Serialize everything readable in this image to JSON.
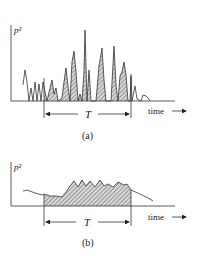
{
  "figure_a": {
    "ylabel": "p²",
    "xlabel": "time",
    "interval_label": "T",
    "caption": "(a)",
    "signal_points": [
      [
        23,
        85
      ],
      [
        25,
        70
      ],
      [
        27,
        82
      ],
      [
        29,
        101
      ],
      [
        31,
        88
      ],
      [
        33,
        101
      ],
      [
        35,
        82
      ],
      [
        37,
        101
      ],
      [
        39,
        84
      ],
      [
        41,
        101
      ],
      [
        43,
        82
      ],
      [
        45,
        92
      ],
      [
        47,
        101
      ],
      [
        50,
        88
      ],
      [
        52,
        80
      ],
      [
        54,
        94
      ],
      [
        56,
        88
      ],
      [
        58,
        101
      ],
      [
        62,
        98
      ],
      [
        64,
        82
      ],
      [
        66,
        68
      ],
      [
        68,
        86
      ],
      [
        70,
        101
      ],
      [
        72,
        62
      ],
      [
        74,
        51
      ],
      [
        76,
        72
      ],
      [
        78,
        101
      ],
      [
        80,
        94
      ],
      [
        82,
        101
      ],
      [
        84,
        72
      ],
      [
        85,
        30
      ],
      [
        87,
        101
      ],
      [
        89,
        70
      ],
      [
        91,
        101
      ],
      [
        96,
        101
      ],
      [
        99,
        66
      ],
      [
        102,
        48
      ],
      [
        104,
        80
      ],
      [
        106,
        101
      ],
      [
        111,
        101
      ],
      [
        114,
        46
      ],
      [
        116,
        85
      ],
      [
        118,
        101
      ],
      [
        120,
        76
      ],
      [
        122,
        72
      ],
      [
        124,
        62
      ],
      [
        126,
        75
      ],
      [
        128,
        101
      ],
      [
        130,
        101
      ],
      [
        131,
        76
      ],
      [
        132,
        101
      ],
      [
        135,
        86
      ],
      [
        137,
        99
      ],
      [
        141,
        101
      ],
      [
        143,
        95
      ],
      [
        146,
        96
      ],
      [
        148,
        98
      ],
      [
        150,
        101
      ]
    ],
    "shaded_range": [
      44,
      131
    ]
  },
  "figure_b": {
    "ylabel": "p²",
    "xlabel": "time",
    "interval_label": "T",
    "caption": "(b)",
    "signal_points": [
      [
        23,
        191
      ],
      [
        27,
        190
      ],
      [
        35,
        193
      ],
      [
        42,
        195
      ],
      [
        44,
        194
      ],
      [
        50,
        196
      ],
      [
        56,
        196
      ],
      [
        62,
        197
      ],
      [
        66,
        192
      ],
      [
        70,
        186
      ],
      [
        74,
        181
      ],
      [
        78,
        187
      ],
      [
        82,
        180
      ],
      [
        86,
        186
      ],
      [
        90,
        181
      ],
      [
        95,
        187
      ],
      [
        100,
        180
      ],
      [
        104,
        186
      ],
      [
        108,
        184
      ],
      [
        113,
        187
      ],
      [
        118,
        182
      ],
      [
        124,
        185
      ],
      [
        127,
        184
      ],
      [
        131,
        190
      ],
      [
        140,
        194
      ],
      [
        148,
        198
      ],
      [
        153,
        201
      ]
    ],
    "shaded_range": [
      44,
      131
    ]
  }
}
